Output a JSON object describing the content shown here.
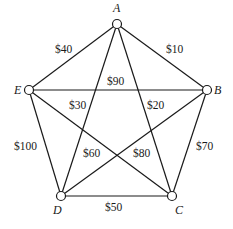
{
  "diagram": {
    "type": "complete-graph-weighted",
    "vertices": [
      {
        "id": "A",
        "label": "A",
        "x": 117,
        "y": 24,
        "lx": 113,
        "ly": 12
      },
      {
        "id": "B",
        "label": "B",
        "x": 207,
        "y": 90,
        "lx": 214,
        "ly": 94
      },
      {
        "id": "C",
        "label": "C",
        "x": 172,
        "y": 196,
        "lx": 175,
        "ly": 214
      },
      {
        "id": "D",
        "label": "D",
        "x": 61,
        "y": 196,
        "lx": 53,
        "ly": 214
      },
      {
        "id": "E",
        "label": "E",
        "x": 29,
        "y": 90,
        "lx": 14,
        "ly": 94
      }
    ],
    "edges": [
      {
        "from": "A",
        "to": "B",
        "weight": "$10",
        "lx": 166,
        "ly": 53
      },
      {
        "from": "A",
        "to": "C",
        "weight": "$20",
        "lx": 147,
        "ly": 109
      },
      {
        "from": "A",
        "to": "D",
        "weight": "$30",
        "lx": 69,
        "ly": 109
      },
      {
        "from": "A",
        "to": "E",
        "weight": "$40",
        "lx": 55,
        "ly": 53
      },
      {
        "from": "C",
        "to": "D",
        "weight": "$50",
        "lx": 105,
        "ly": 211
      },
      {
        "from": "C",
        "to": "E",
        "weight": "$60",
        "lx": 83,
        "ly": 157
      },
      {
        "from": "B",
        "to": "C",
        "weight": "$70",
        "lx": 196,
        "ly": 150
      },
      {
        "from": "B",
        "to": "D",
        "weight": "$80",
        "lx": 133,
        "ly": 157
      },
      {
        "from": "B",
        "to": "E",
        "weight": "$90",
        "lx": 107,
        "ly": 85
      },
      {
        "from": "D",
        "to": "E",
        "weight": "$100",
        "lx": 14,
        "ly": 150
      }
    ]
  }
}
